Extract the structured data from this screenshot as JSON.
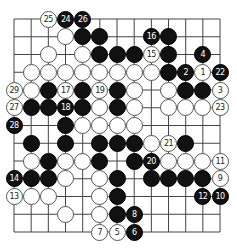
{
  "diagram": {
    "type": "go-board-section",
    "columns": 13,
    "rows": 13,
    "grid": {
      "x0": 14,
      "y0": 19,
      "dx": 17.17,
      "dy": 17.75
    },
    "colors": {
      "black": "#111111",
      "white": "#ffffff",
      "line": "#444444"
    },
    "stones": [
      {
        "row": 0,
        "col": 2,
        "color": "white",
        "label": "25"
      },
      {
        "row": 0,
        "col": 3,
        "color": "black",
        "label": "24"
      },
      {
        "row": 0,
        "col": 4,
        "color": "black",
        "label": "26"
      },
      {
        "row": 1,
        "col": 3,
        "color": "white",
        "label": ""
      },
      {
        "row": 1,
        "col": 4,
        "color": "black",
        "label": ""
      },
      {
        "row": 1,
        "col": 5,
        "color": "black",
        "label": ""
      },
      {
        "row": 1,
        "col": 8,
        "color": "black",
        "label": "16"
      },
      {
        "row": 1,
        "col": 9,
        "color": "black",
        "label": ""
      },
      {
        "row": 2,
        "col": 2,
        "color": "white",
        "label": ""
      },
      {
        "row": 2,
        "col": 4,
        "color": "white",
        "label": ""
      },
      {
        "row": 2,
        "col": 5,
        "color": "black",
        "label": ""
      },
      {
        "row": 2,
        "col": 6,
        "color": "black",
        "label": ""
      },
      {
        "row": 2,
        "col": 7,
        "color": "black",
        "label": ""
      },
      {
        "row": 2,
        "col": 8,
        "color": "white",
        "label": "15"
      },
      {
        "row": 2,
        "col": 9,
        "color": "black",
        "label": ""
      },
      {
        "row": 2,
        "col": 11,
        "color": "black",
        "label": "4"
      },
      {
        "row": 3,
        "col": 1,
        "color": "white",
        "label": ""
      },
      {
        "row": 3,
        "col": 2,
        "color": "white",
        "label": ""
      },
      {
        "row": 3,
        "col": 3,
        "color": "white",
        "label": ""
      },
      {
        "row": 3,
        "col": 4,
        "color": "white",
        "label": ""
      },
      {
        "row": 3,
        "col": 5,
        "color": "white",
        "label": ""
      },
      {
        "row": 3,
        "col": 6,
        "color": "white",
        "label": ""
      },
      {
        "row": 3,
        "col": 7,
        "color": "white",
        "label": ""
      },
      {
        "row": 3,
        "col": 8,
        "color": "white",
        "label": ""
      },
      {
        "row": 3,
        "col": 9,
        "color": "black",
        "label": ""
      },
      {
        "row": 3,
        "col": 10,
        "color": "black",
        "label": "2"
      },
      {
        "row": 3,
        "col": 11,
        "color": "white",
        "label": "1"
      },
      {
        "row": 3,
        "col": 12,
        "color": "black",
        "label": "22"
      },
      {
        "row": 4,
        "col": 0,
        "color": "white",
        "label": "29"
      },
      {
        "row": 4,
        "col": 1,
        "color": "white",
        "label": ""
      },
      {
        "row": 4,
        "col": 2,
        "color": "black",
        "label": ""
      },
      {
        "row": 4,
        "col": 3,
        "color": "white",
        "label": "17"
      },
      {
        "row": 4,
        "col": 4,
        "color": "black",
        "label": ""
      },
      {
        "row": 4,
        "col": 5,
        "color": "white",
        "label": "19"
      },
      {
        "row": 4,
        "col": 6,
        "color": "black",
        "label": ""
      },
      {
        "row": 4,
        "col": 7,
        "color": "white",
        "label": ""
      },
      {
        "row": 4,
        "col": 9,
        "color": "white",
        "label": ""
      },
      {
        "row": 4,
        "col": 10,
        "color": "black",
        "label": ""
      },
      {
        "row": 4,
        "col": 11,
        "color": "black",
        "label": ""
      },
      {
        "row": 4,
        "col": 12,
        "color": "white",
        "label": "3"
      },
      {
        "row": 5,
        "col": 0,
        "color": "white",
        "label": "27"
      },
      {
        "row": 5,
        "col": 1,
        "color": "black",
        "label": ""
      },
      {
        "row": 5,
        "col": 2,
        "color": "black",
        "label": ""
      },
      {
        "row": 5,
        "col": 3,
        "color": "black",
        "label": "18"
      },
      {
        "row": 5,
        "col": 4,
        "color": "black",
        "label": ""
      },
      {
        "row": 5,
        "col": 5,
        "color": "white",
        "label": ""
      },
      {
        "row": 5,
        "col": 6,
        "color": "black",
        "label": ""
      },
      {
        "row": 5,
        "col": 7,
        "color": "white",
        "label": ""
      },
      {
        "row": 5,
        "col": 9,
        "color": "white",
        "label": ""
      },
      {
        "row": 5,
        "col": 10,
        "color": "white",
        "label": ""
      },
      {
        "row": 5,
        "col": 11,
        "color": "white",
        "label": ""
      },
      {
        "row": 5,
        "col": 12,
        "color": "white",
        "label": "23"
      },
      {
        "row": 6,
        "col": 0,
        "color": "black",
        "label": "28"
      },
      {
        "row": 6,
        "col": 3,
        "color": "black",
        "label": ""
      },
      {
        "row": 6,
        "col": 4,
        "color": "white",
        "label": ""
      },
      {
        "row": 6,
        "col": 5,
        "color": "white",
        "label": ""
      },
      {
        "row": 6,
        "col": 6,
        "color": "white",
        "label": ""
      },
      {
        "row": 6,
        "col": 7,
        "color": "white",
        "label": ""
      },
      {
        "row": 7,
        "col": 1,
        "color": "black",
        "label": ""
      },
      {
        "row": 7,
        "col": 3,
        "color": "black",
        "label": ""
      },
      {
        "row": 7,
        "col": 5,
        "color": "black",
        "label": ""
      },
      {
        "row": 7,
        "col": 6,
        "color": "black",
        "label": ""
      },
      {
        "row": 7,
        "col": 7,
        "color": "black",
        "label": ""
      },
      {
        "row": 7,
        "col": 8,
        "color": "white",
        "label": ""
      },
      {
        "row": 7,
        "col": 9,
        "color": "white",
        "label": "21"
      },
      {
        "row": 7,
        "col": 10,
        "color": "black",
        "label": ""
      },
      {
        "row": 8,
        "col": 1,
        "color": "white",
        "label": ""
      },
      {
        "row": 8,
        "col": 2,
        "color": "black",
        "label": ""
      },
      {
        "row": 8,
        "col": 3,
        "color": "white",
        "label": ""
      },
      {
        "row": 8,
        "col": 4,
        "color": "white",
        "label": ""
      },
      {
        "row": 8,
        "col": 5,
        "color": "black",
        "label": ""
      },
      {
        "row": 8,
        "col": 7,
        "color": "black",
        "label": ""
      },
      {
        "row": 8,
        "col": 8,
        "color": "black",
        "label": "20"
      },
      {
        "row": 8,
        "col": 9,
        "color": "white",
        "label": ""
      },
      {
        "row": 8,
        "col": 10,
        "color": "white",
        "label": ""
      },
      {
        "row": 8,
        "col": 11,
        "color": "white",
        "label": ""
      },
      {
        "row": 8,
        "col": 12,
        "color": "white",
        "label": "11"
      },
      {
        "row": 9,
        "col": 0,
        "color": "black",
        "label": "14"
      },
      {
        "row": 9,
        "col": 1,
        "color": "black",
        "label": ""
      },
      {
        "row": 9,
        "col": 2,
        "color": "black",
        "label": ""
      },
      {
        "row": 9,
        "col": 3,
        "color": "white",
        "label": ""
      },
      {
        "row": 9,
        "col": 5,
        "color": "white",
        "label": ""
      },
      {
        "row": 9,
        "col": 6,
        "color": "black",
        "label": ""
      },
      {
        "row": 9,
        "col": 8,
        "color": "black",
        "label": ""
      },
      {
        "row": 9,
        "col": 9,
        "color": "black",
        "label": ""
      },
      {
        "row": 9,
        "col": 10,
        "color": "black",
        "label": ""
      },
      {
        "row": 9,
        "col": 11,
        "color": "black",
        "label": ""
      },
      {
        "row": 9,
        "col": 12,
        "color": "white",
        "label": "9"
      },
      {
        "row": 10,
        "col": 0,
        "color": "white",
        "label": "13"
      },
      {
        "row": 10,
        "col": 1,
        "color": "white",
        "label": ""
      },
      {
        "row": 10,
        "col": 2,
        "color": "white",
        "label": ""
      },
      {
        "row": 10,
        "col": 5,
        "color": "white",
        "label": ""
      },
      {
        "row": 10,
        "col": 6,
        "color": "black",
        "label": ""
      },
      {
        "row": 10,
        "col": 11,
        "color": "black",
        "label": "12"
      },
      {
        "row": 10,
        "col": 12,
        "color": "black",
        "label": "10"
      },
      {
        "row": 11,
        "col": 3,
        "color": "white",
        "label": ""
      },
      {
        "row": 11,
        "col": 5,
        "color": "white",
        "label": ""
      },
      {
        "row": 11,
        "col": 6,
        "color": "black",
        "label": ""
      },
      {
        "row": 11,
        "col": 7,
        "color": "black",
        "label": "8"
      },
      {
        "row": 12,
        "col": 5,
        "color": "white",
        "label": "7"
      },
      {
        "row": 12,
        "col": 6,
        "color": "white",
        "label": "5"
      },
      {
        "row": 12,
        "col": 7,
        "color": "black",
        "label": "6"
      }
    ]
  }
}
